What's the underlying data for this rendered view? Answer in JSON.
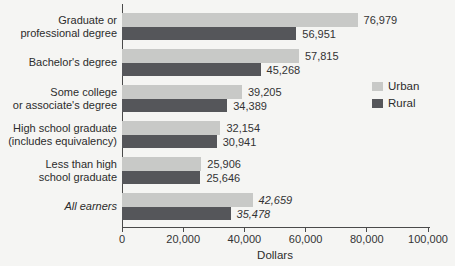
{
  "page": {
    "background": "#f5f5f3"
  },
  "chart_data": {
    "type": "bar",
    "orientation": "horizontal",
    "xlabel": "Dollars",
    "xlim": [
      0,
      100000
    ],
    "xticks": [
      {
        "value": 0,
        "label": "0"
      },
      {
        "value": 20000,
        "label": "20,000"
      },
      {
        "value": 40000,
        "label": "40,000"
      },
      {
        "value": 60000,
        "label": "60,000"
      },
      {
        "value": 80000,
        "label": "80,000"
      },
      {
        "value": 100000,
        "label": "100,000"
      }
    ],
    "categories": [
      [
        "Graduate or",
        "professional degree"
      ],
      [
        "Bachelor's degree"
      ],
      [
        "Some college",
        "or associate's degree"
      ],
      [
        "High school graduate",
        "(includes equivalency)"
      ],
      [
        "Less than high",
        "school graduate"
      ],
      [
        "All earners"
      ]
    ],
    "italic_flags": [
      false,
      false,
      false,
      false,
      false,
      true
    ],
    "series": [
      {
        "name": "Urban",
        "color": "#c8c9c7",
        "values": [
          76979,
          57815,
          39205,
          32154,
          25906,
          42659
        ],
        "labels": [
          "76,979",
          "57,815",
          "39,205",
          "32,154",
          "25,906",
          "42,659"
        ]
      },
      {
        "name": "Rural",
        "color": "#55565a",
        "values": [
          56951,
          45268,
          34389,
          30941,
          25646,
          35478
        ],
        "labels": [
          "56,951",
          "45,268",
          "34,389",
          "30,941",
          "25,646",
          "35,478"
        ]
      }
    ],
    "legend": {
      "position": "right",
      "entries": [
        "Urban",
        "Rural"
      ]
    },
    "axis_color": "#4a4a4a",
    "text_color": "#2c2c2c",
    "grid": false
  }
}
